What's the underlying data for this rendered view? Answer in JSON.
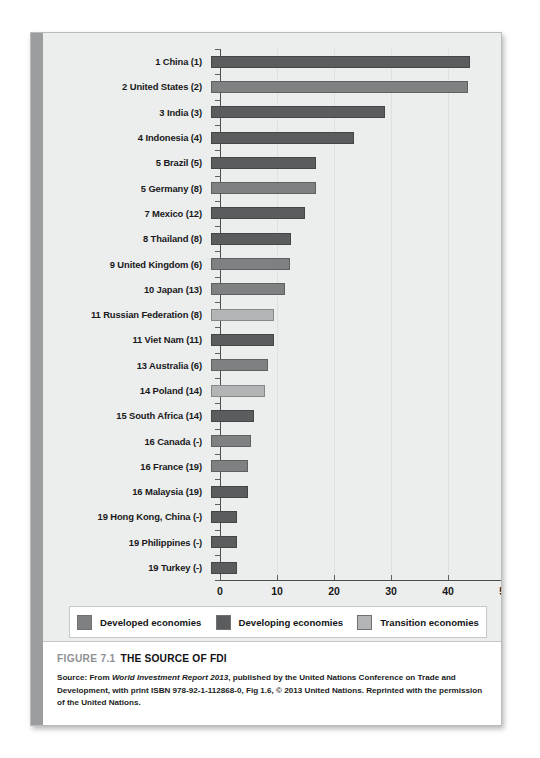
{
  "figure": {
    "label": "FIGURE 7.1",
    "title": "THE SOURCE OF FDI",
    "source_line_1_a": "Source: From ",
    "source_line_1_italic": "World Investment Report 2013",
    "source_line_1_b": ", published by the United Nations Conference on Trade and Development, with print",
    "source_line_2": "ISBN 978-92-1-112868-0, Fig 1.6, © 2013 United Nations. Reprinted with the permission of the United Nations."
  },
  "legend": {
    "position": "bottom",
    "items": [
      {
        "label": "Developed economies",
        "color": "#7e8082",
        "key": "developed"
      },
      {
        "label": "Developing economies",
        "color": "#5a5c5e",
        "key": "developing"
      },
      {
        "label": "Transition economies",
        "color": "#b2b4b6",
        "key": "transition"
      }
    ]
  },
  "chart_data": {
    "type": "bar",
    "orientation": "horizontal",
    "title": "THE SOURCE OF FDI",
    "xlabel": "",
    "ylabel": "",
    "xlim": [
      0,
      50
    ],
    "xticks": [
      0,
      10,
      20,
      30,
      40,
      50
    ],
    "grid": true,
    "categories": [
      "1 China (1)",
      "2 United States (2)",
      "3 India (3)",
      "4 Indonesia (4)",
      "5 Brazil (5)",
      "5 Germany (8)",
      "7 Mexico (12)",
      "8 Thailand (8)",
      "9 United Kingdom (6)",
      "10 Japan (13)",
      "11 Russian Federation (8)",
      "11 Viet Nam (11)",
      "13 Australia (6)",
      "14 Poland (14)",
      "15 South Africa (14)",
      "16 Canada (-)",
      "16 France (19)",
      "16 Malaysia (19)",
      "19 Hong Kong, China (-)",
      "19 Philippines (-)",
      "19 Turkey (-)"
    ],
    "values": [
      45.5,
      45.0,
      30.5,
      25.0,
      18.5,
      18.5,
      16.5,
      14.0,
      13.8,
      13.0,
      11.0,
      11.0,
      10.0,
      9.5,
      7.5,
      7.0,
      6.5,
      6.5,
      4.5,
      4.5,
      4.5
    ],
    "groups": [
      "developing",
      "developed",
      "developing",
      "developing",
      "developing",
      "developed",
      "developing",
      "developing",
      "developed",
      "developed",
      "transition",
      "developing",
      "developed",
      "transition",
      "developing",
      "developed",
      "developed",
      "developing",
      "developing",
      "developing",
      "developing"
    ]
  }
}
